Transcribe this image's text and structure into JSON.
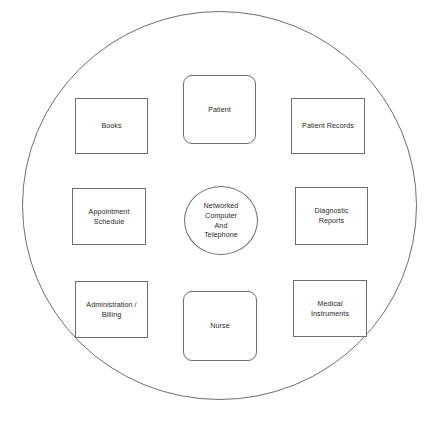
{
  "diagram": {
    "boundary": {
      "shape_name": "outer-ellipse",
      "stroke_color": "#6e6e6e",
      "fill_color": "#ffffff"
    },
    "style": {
      "node_stroke": "#6e6e6e",
      "node_fill": "#ffffff",
      "text_color": "#2a2a2a"
    },
    "center": {
      "id": "networked-computer-and-telephone",
      "shape": "circle",
      "label": "Networked\nComputer\nAnd\nTelephone"
    },
    "nodes": [
      {
        "id": "books",
        "shape": "rectangle",
        "label": "Books",
        "row": "top",
        "column": "left"
      },
      {
        "id": "patient",
        "shape": "rounded-rectangle",
        "label": "Patient",
        "row": "top",
        "column": "center"
      },
      {
        "id": "patient-records",
        "shape": "rectangle",
        "label": "Patient Records",
        "row": "top",
        "column": "right"
      },
      {
        "id": "appointment-schedule",
        "shape": "rectangle",
        "label": "Appointment\nSchedule",
        "row": "middle",
        "column": "left"
      },
      {
        "id": "diagnostic-reports",
        "shape": "rectangle",
        "label": "Diagnostic\nReports",
        "row": "middle",
        "column": "right"
      },
      {
        "id": "administration-billing",
        "shape": "rectangle",
        "label": "Administration /\nBilling",
        "row": "bottom",
        "column": "left"
      },
      {
        "id": "nurse",
        "shape": "rounded-rectangle",
        "label": "Nurse",
        "row": "bottom",
        "column": "center"
      },
      {
        "id": "medical-instruments",
        "shape": "rectangle",
        "label": "Medical\nInstruments",
        "row": "bottom",
        "column": "right"
      }
    ]
  }
}
